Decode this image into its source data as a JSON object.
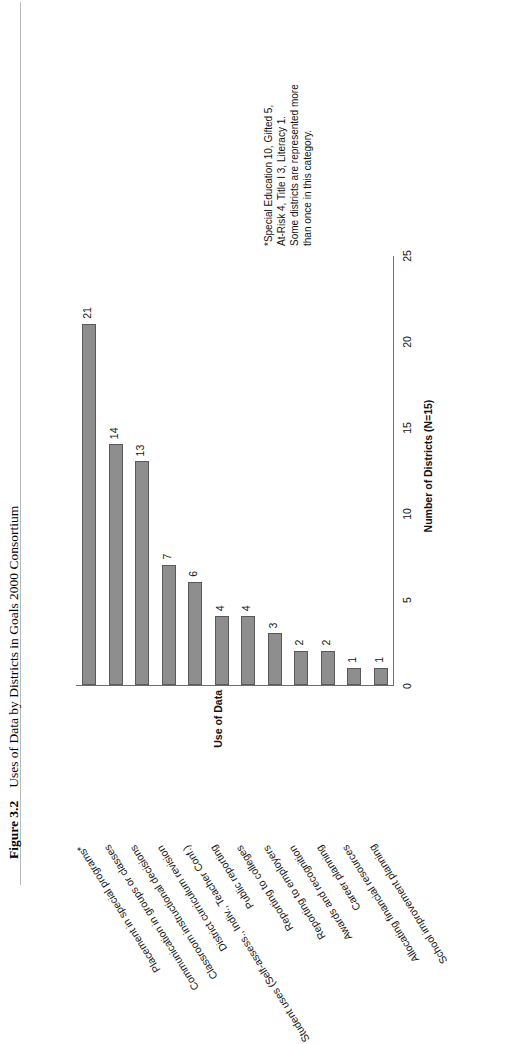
{
  "page": {
    "caption_number": "Figure 3.2",
    "caption_title": "Uses of Data by Districts in Goals 2000 Consortium"
  },
  "footnote": {
    "line1": "*Special Education 10, Gifted 5,",
    "line2": "At-Risk 4, Title I 3, Literacy 1.",
    "line3": "Some districts are represented more",
    "line4": "than once in this category."
  },
  "chart_data": {
    "type": "bar",
    "orientation": "horizontal",
    "title": "Uses of Data by Districts in Goals 2000 Consortium",
    "xlabel": "Number of Districts (N=15)",
    "ylabel": "Use of Data",
    "xlim": [
      0,
      25
    ],
    "xticks": [
      0,
      5,
      10,
      15,
      20,
      25
    ],
    "grid": false,
    "legend": false,
    "bar_color": "#8e8e8e",
    "bar_edge_color": "#59595b",
    "categories": [
      "Placement in special programs*",
      "Communication in groups or classes",
      "Classroom instructional decisions",
      "District curriculum revision",
      "Student uses (Self-assess., Indiv., Teacher Conf.)",
      "Public reporting",
      "Reporting to colleges",
      "Reporting to employers",
      "Awards and recognition",
      "Career planning",
      "Allocating financial resources",
      "School improvement planning"
    ],
    "values": [
      21,
      14,
      13,
      7,
      6,
      4,
      4,
      3,
      2,
      2,
      1,
      1
    ],
    "value_labels": [
      "21",
      "14",
      "13",
      "7",
      "6",
      "4",
      "4",
      "3",
      "2",
      "2",
      "1",
      "1"
    ],
    "zero_marker_label": "0"
  }
}
